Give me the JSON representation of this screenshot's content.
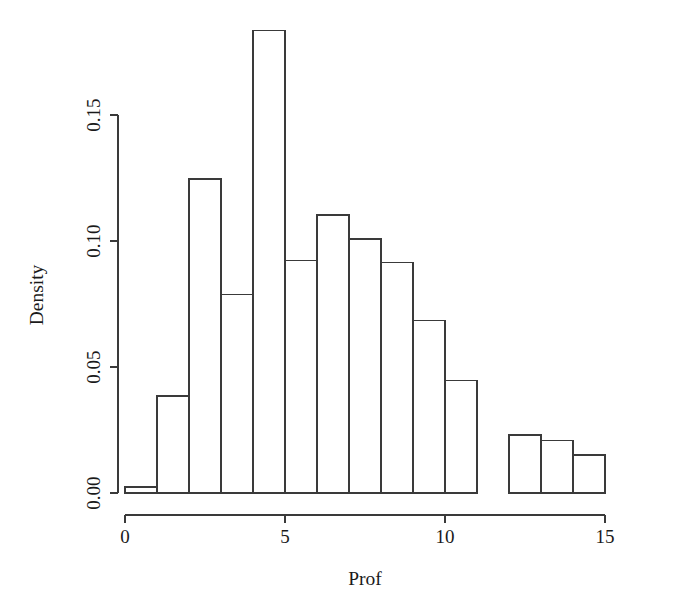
{
  "chart_data": {
    "type": "bar",
    "title": "",
    "subtitle": "",
    "xlabel": "Prof",
    "ylabel": "Density",
    "grid": false,
    "legend": null,
    "xlim": [
      0,
      15
    ],
    "ylim": [
      0,
      0.1837
    ],
    "x_ticks": [
      {
        "value": 0,
        "label": "0"
      },
      {
        "value": 5,
        "label": "5"
      },
      {
        "value": 10,
        "label": "10"
      },
      {
        "value": 15,
        "label": "15"
      }
    ],
    "y_ticks": [
      {
        "value": 0.0,
        "label": "0.00"
      },
      {
        "value": 0.05,
        "label": "0.05"
      },
      {
        "value": 0.1,
        "label": "0.10"
      },
      {
        "value": 0.15,
        "label": "0.15"
      }
    ],
    "bin_width": 1,
    "categories": [
      "0-1",
      "1-2",
      "2-3",
      "3-4",
      "4-5",
      "5-6",
      "6-7",
      "7-8",
      "8-9",
      "9-10",
      "10-11",
      "11-12",
      "12-13",
      "13-14",
      "14-15"
    ],
    "bin_edges": [
      0,
      1,
      2,
      3,
      4,
      5,
      6,
      7,
      8,
      9,
      10,
      11,
      12,
      13,
      14,
      15
    ],
    "values": [
      0.0024,
      0.0385,
      0.1246,
      0.0786,
      0.1837,
      0.0921,
      0.1103,
      0.1008,
      0.0913,
      0.0683,
      0.0448,
      0.0,
      0.023,
      0.021,
      0.0151
    ],
    "colors": {
      "bar_fill": "#ffffff",
      "bar_stroke": "#3a3a3a",
      "axis": "#3a3a3a",
      "text": "#1a1a1a",
      "background": "#ffffff"
    }
  }
}
